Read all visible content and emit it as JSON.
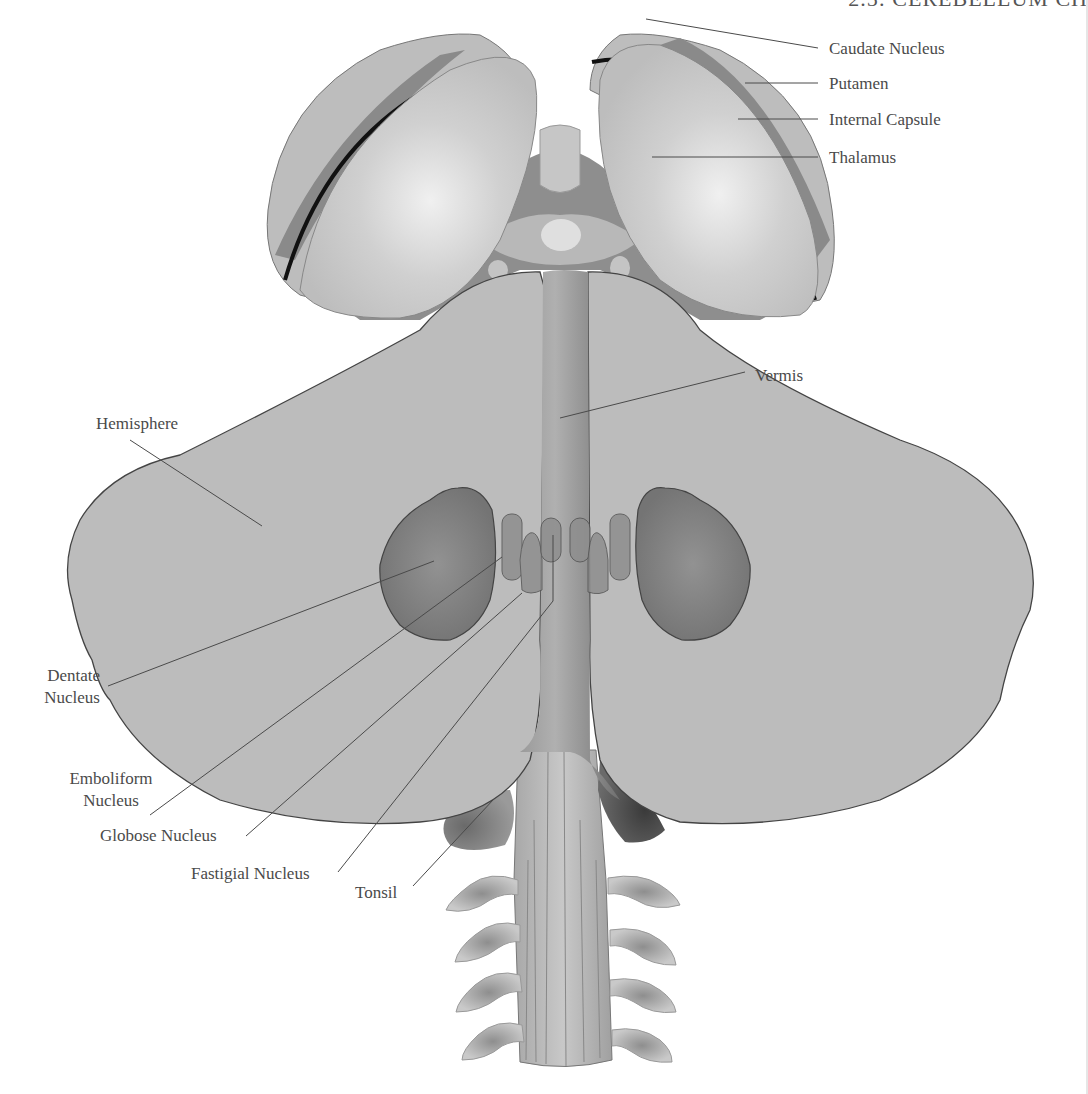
{
  "page_header": "2.5: CEREBELLUM   CH",
  "figure": {
    "colors": {
      "tissue_light": "#c4c4c4",
      "tissue_mid": "#a8a8a8",
      "tissue_dark": "#7a7a7a",
      "nucleus_fill": "#7c7c7c",
      "capsule_band": "#8c8c8c",
      "outline": "#3a3a3a",
      "leader_line": "#4a4a4a",
      "label_text": "#4a4a4a"
    }
  },
  "labels": {
    "caudate_nucleus": "Caudate Nucleus",
    "putamen": "Putamen",
    "internal_capsule": "Internal Capsule",
    "thalamus": "Thalamus",
    "vermis": "Vermis",
    "hemisphere": "Hemisphere",
    "dentate_line1": "Dentate",
    "dentate_line2": "Nucleus",
    "emboliform_line1": "Emboliform",
    "emboliform_line2": "Nucleus",
    "globose_nucleus": "Globose Nucleus",
    "fastigial_nucleus": "Fastigial Nucleus",
    "tonsil": "Tonsil"
  }
}
